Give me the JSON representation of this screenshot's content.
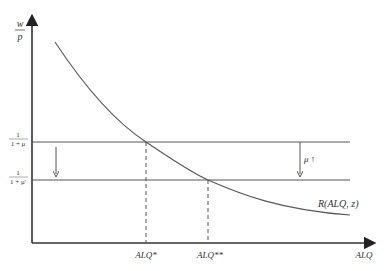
{
  "diagram": {
    "type": "economic-diagram",
    "y_axis": {
      "label_numerator": "w",
      "label_denominator": "p"
    },
    "x_axis": {
      "label": "ALQ"
    },
    "horizontal_lines": [
      {
        "id": "upper",
        "numerator": "1",
        "denominator": "1 + μ",
        "y": 142
      },
      {
        "id": "lower",
        "numerator": "1",
        "denominator": "1 + μ'",
        "y": 180
      }
    ],
    "curve": {
      "label": "R(ALQ, z)"
    },
    "shift_annotation": {
      "label": "μ ↑"
    },
    "equilibria": [
      {
        "label": "ALQ*",
        "x": 146
      },
      {
        "label": "ALQ**",
        "x": 208
      }
    ],
    "colors": {
      "line": "#555555",
      "axis": "#333333",
      "background": "#ffffff"
    }
  }
}
